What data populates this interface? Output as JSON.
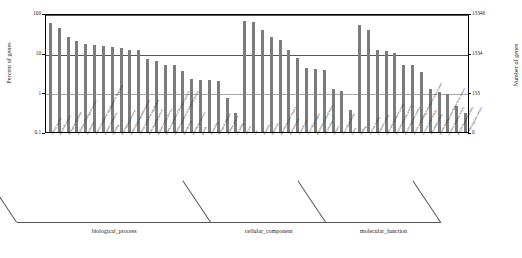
{
  "chart_data": {
    "type": "bar",
    "title": "",
    "xlabel": "",
    "ylabel": "Percent of genes",
    "ylabel_right": "Number of genes",
    "yscale": "log",
    "ylim": [
      0.1,
      100
    ],
    "ytick_labels_left": [
      "100",
      "10",
      "1",
      "0.1"
    ],
    "ytick_values_left": [
      100,
      10,
      1,
      0.1
    ],
    "ytick_labels_right": [
      "13346",
      "1334",
      "133",
      "0"
    ],
    "ytick_values_right": [
      13346,
      1334,
      133,
      0
    ],
    "grid": true,
    "legend": "none",
    "bar_color": "#7c7c7c",
    "groups": [
      {
        "name": "biological_process",
        "label": "biological_process",
        "count": 22
      },
      {
        "name": "cellular_component",
        "label": "cellular_component",
        "count": 13
      },
      {
        "name": "molecular_function",
        "label": "molecular_function",
        "count": 13
      }
    ],
    "categories": [
      "cellular process",
      "metabolic process",
      "biological regulation",
      "regulation of biological process",
      "localization",
      "cellular component organization or biogenesis",
      "response to stimulus",
      "signaling",
      "developmental process",
      "multicellular organismal process",
      "cellular component organization",
      "multi-organism process",
      "immune system process",
      "positive regulation of biological process",
      "negative regulation of biological process",
      "reproduction",
      "reproductive process",
      "growth",
      "locomotion",
      "biological adhesion",
      "rhythmic process",
      "cell killing",
      "cell part",
      "cell",
      "organelle",
      "membrane",
      "macromolecular complex",
      "membrane part",
      "organelle part",
      "extracellular region",
      "membrane-enclosed lumen",
      "cell junction",
      "synapse",
      "extracellular matrix",
      "virion",
      "binding",
      "catalytic activity",
      "transporter activity",
      "molecular transducer activity",
      "structural molecule activity",
      "enzyme regulator activity",
      "nucleic acid binding transcription factor activity",
      "electron carrier activity",
      "antioxidant activity",
      "protein binding transcription factor activity",
      "receptor regulator activity",
      "metallochaperone activity",
      "channel regulator activity"
    ],
    "values": [
      55,
      43,
      25,
      20,
      17,
      16,
      15,
      14,
      13,
      12,
      12,
      7.0,
      6.0,
      5.0,
      4.9,
      3.4,
      2.2,
      2.1,
      2.0,
      1.9,
      0.7,
      0.3,
      62,
      60,
      38,
      25,
      21,
      12,
      7.5,
      4.0,
      3.8,
      3.7,
      1.2,
      1.1,
      0.35,
      50,
      38,
      12,
      11,
      10,
      5.0,
      5.0,
      3.2,
      1.2,
      1.0,
      0.9,
      0.45,
      0.3
    ]
  }
}
